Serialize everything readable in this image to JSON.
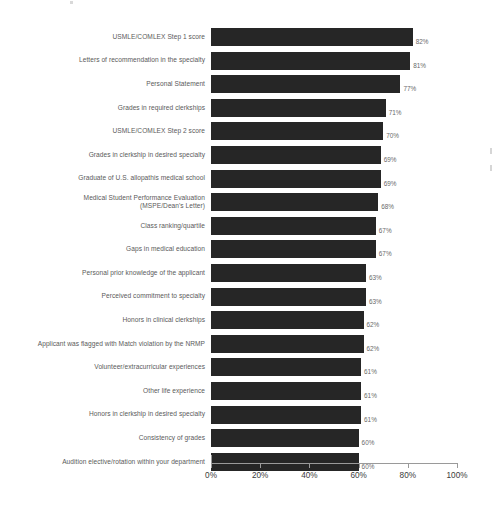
{
  "chart_data": {
    "type": "bar",
    "orientation": "horizontal",
    "title": "",
    "subtitle": "",
    "xlabel": "",
    "ylabel": "",
    "xlim": [
      0,
      100
    ],
    "grid": false,
    "legend": null,
    "bar_color": "#262626",
    "value_label_suffix": "%",
    "axis_tick_labels": [
      "0%",
      "20%",
      "40%",
      "60%",
      "80%",
      "100%"
    ],
    "axis_tick_values": [
      0,
      20,
      40,
      60,
      80,
      100
    ],
    "categories": [
      "USMLE/COMLEX Step 1 score",
      "Letters of recommendation in the specialty",
      "Personal Statement",
      "Grades in required clerkships",
      "USMLE/COMLEX Step 2 score",
      "Grades in clerkship in desired specialty",
      "Graduate of U.S. allopathis medical school",
      "Medical Student Performance Evaluation\n(MSPE/Dean's Letter)",
      "Class ranking/quartile",
      "Gaps in medical education",
      "Personal prior knowledge of the applicant",
      "Perceived commitment to specialty",
      "Honors in clinical clerkships",
      "Applicant was flagged with Match violation by the NRMP",
      "Volunteer/extracurricular experiences",
      "Other life experience",
      "Honors in clerkship in desired specialty",
      "Consistency of grades",
      "Audition elective/rotation within your department"
    ],
    "values": [
      82,
      81,
      77,
      71,
      70,
      69,
      69,
      68,
      67,
      67,
      63,
      63,
      62,
      62,
      61,
      61,
      61,
      60,
      60
    ],
    "value_labels": [
      "82%",
      "81%",
      "77%",
      "71%",
      "70%",
      "69%",
      "69%",
      "68%",
      "67%",
      "67%",
      "63%",
      "63%",
      "62%",
      "62%",
      "61%",
      "61%",
      "61%",
      "60%",
      "60%"
    ]
  }
}
